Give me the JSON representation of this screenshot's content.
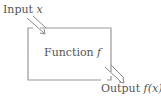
{
  "diagram": {
    "type": "function-machine",
    "input": {
      "text": "Input ",
      "var": "x"
    },
    "box": {
      "text": "Function ",
      "var": "f"
    },
    "output": {
      "text": "Output ",
      "var": "f(x)"
    },
    "colors": {
      "stroke": "#888888",
      "text": "#555555",
      "background": "#ffffff"
    }
  }
}
